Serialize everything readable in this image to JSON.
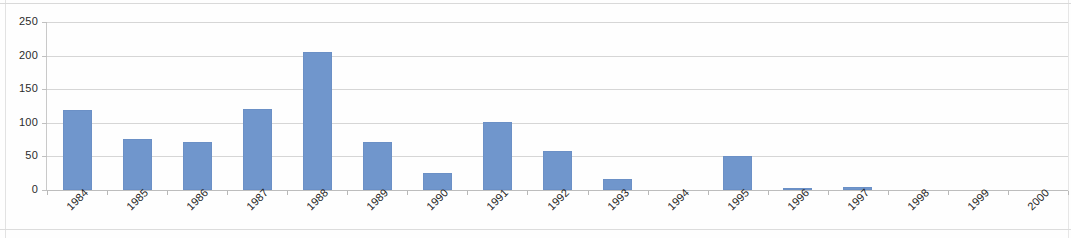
{
  "chart_data": {
    "type": "bar",
    "title": "",
    "subtitle": "",
    "xlabel": "",
    "ylabel": "",
    "categories": [
      "1984",
      "1985",
      "1986",
      "1987",
      "1988",
      "1989",
      "1990",
      "1991",
      "1992",
      "1993",
      "1994",
      "1995",
      "1996",
      "1997",
      "1998",
      "1999",
      "2000"
    ],
    "values": [
      119,
      76,
      72,
      120,
      206,
      72,
      26,
      101,
      58,
      16,
      0,
      50,
      2,
      5,
      0,
      0,
      0
    ],
    "series": [
      {
        "name": "",
        "values": [
          119,
          76,
          72,
          120,
          206,
          72,
          26,
          101,
          58,
          16,
          0,
          50,
          2,
          5,
          0,
          0,
          0
        ]
      }
    ],
    "ylim": [
      0,
      250
    ],
    "y_ticks": [
      0,
      50,
      100,
      150,
      200,
      250
    ],
    "y_tick_labels": [
      "0",
      "50",
      "100",
      "150",
      "200",
      "250"
    ],
    "grid": true,
    "grid_axis": "y",
    "legend": false,
    "legend_position": "none",
    "bar_color": "#7096cc",
    "gridline_color": "#d6d6d6",
    "axis_color": "#bdbdbd",
    "background_color": "#ffffff",
    "x_tick_label_rotation": -45
  }
}
